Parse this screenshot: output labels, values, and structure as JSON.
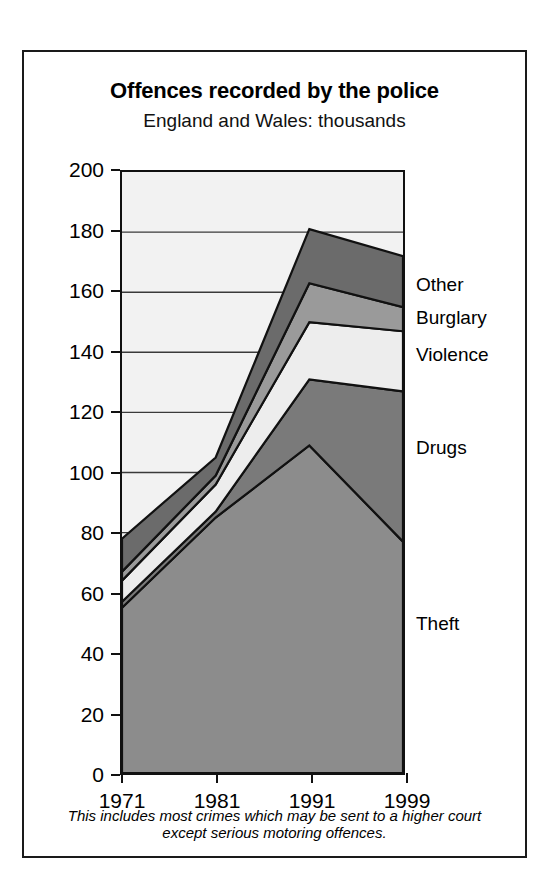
{
  "figure": {
    "title": "Offences recorded by the police",
    "subtitle": "England and Wales: thousands",
    "footnote_line1": "This includes most crimes which may be sent to a higher court",
    "footnote_line2": "except serious motoring offences."
  },
  "colors": {
    "frame": "#1a1a1a",
    "plot_background": "#f2f2f2",
    "gridline": "#3a3a3a",
    "outline": "#111111",
    "theft": "#8c8c8c",
    "drugs": "#7a7a7a",
    "violence": "#ededed",
    "burglary": "#9a9a9a",
    "other": "#6b6b6b"
  },
  "chart_data": {
    "type": "area",
    "title": "Offences recorded by the police",
    "subtitle": "England and Wales: thousands",
    "xlabel": "",
    "ylabel": "thousands",
    "stacked": true,
    "grid": true,
    "legend_position": "right-inline",
    "x": [
      "1971",
      "1981",
      "1991",
      "1999"
    ],
    "xtick_labels": [
      "1971",
      "1981",
      "1991",
      "1999"
    ],
    "ytick_labels": [
      "0",
      "20",
      "40",
      "60",
      "80",
      "100",
      "120",
      "140",
      "160",
      "180",
      "200"
    ],
    "yticks": [
      0,
      20,
      40,
      60,
      80,
      100,
      120,
      140,
      160,
      180,
      200
    ],
    "ylim": [
      0,
      200
    ],
    "series": [
      {
        "name": "Theft",
        "values": [
          55,
          85,
          109,
          77
        ]
      },
      {
        "name": "Drugs",
        "values": [
          2,
          2,
          22,
          50
        ]
      },
      {
        "name": "Violence",
        "values": [
          7,
          9,
          19,
          20
        ]
      },
      {
        "name": "Burglary",
        "values": [
          3,
          3,
          13,
          8
        ]
      },
      {
        "name": "Other",
        "values": [
          11,
          6,
          18,
          17
        ]
      }
    ],
    "cumulative_totals": [
      78,
      105,
      181,
      172
    ],
    "annotations": [
      {
        "text": "Other",
        "value": 162
      },
      {
        "text": "Burglary",
        "value": 151
      },
      {
        "text": "Violence",
        "value": 139
      },
      {
        "text": "Drugs",
        "value": 108
      },
      {
        "text": "Theft",
        "value": 50
      }
    ]
  }
}
